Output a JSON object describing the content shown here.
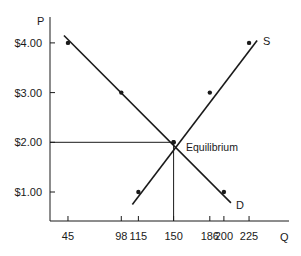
{
  "chart_data": {
    "type": "line",
    "title": "",
    "xlabel": "Q",
    "ylabel": "P",
    "x_ticks": [
      45,
      98,
      115,
      150,
      186,
      200,
      225
    ],
    "y_ticks": [
      "$1.00",
      "$2.00",
      "$3.00",
      "$4.00"
    ],
    "y_tick_values": [
      1,
      2,
      3,
      4
    ],
    "series": [
      {
        "name": "D",
        "points": [
          [
            45,
            4.0
          ],
          [
            98,
            3.0
          ],
          [
            150,
            2.0
          ],
          [
            200,
            1.0
          ]
        ],
        "line_from": [
          41,
          4.15
        ],
        "line_to": [
          207,
          0.78
        ]
      },
      {
        "name": "S",
        "points": [
          [
            115,
            1.0
          ],
          [
            150,
            2.0
          ],
          [
            186,
            3.0
          ],
          [
            225,
            4.0
          ]
        ],
        "line_from": [
          109,
          0.75
        ],
        "line_to": [
          233,
          4.05
        ]
      }
    ],
    "annotations": [
      {
        "text": "Equilibrium",
        "x": 150,
        "y": 2.0
      }
    ],
    "guides": {
      "equilibrium_quantity": 150,
      "equilibrium_price": 2.0
    },
    "grid": false,
    "legend": "none"
  },
  "labels": {
    "p_axis": "P",
    "q_axis": "Q",
    "supply": "S",
    "demand": "D",
    "equilibrium": "Equilibrium"
  },
  "colors": {
    "ink": "#1a1a1a",
    "background": "#ffffff"
  }
}
